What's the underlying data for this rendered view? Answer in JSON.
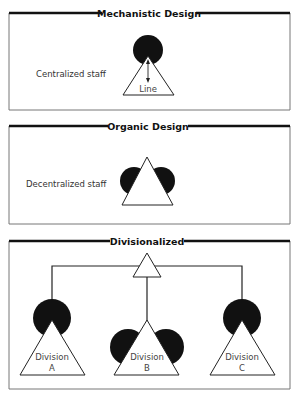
{
  "panels": [
    {
      "title": "Mechanistic Design",
      "side_label": "Centralized staff",
      "line_label": "Line"
    },
    {
      "title": "Organic Design",
      "side_label": "Decentralized staff"
    },
    {
      "title": "Divisionalized",
      "divisions": [
        {
          "label": "Division",
          "letter": "A"
        },
        {
          "label": "Division",
          "letter": "B"
        },
        {
          "label": "Division",
          "letter": "C"
        }
      ]
    }
  ],
  "colors": {
    "staff": "#111111",
    "line": "#ffffff",
    "frame_top": "#111111",
    "frame_side": "#777777"
  },
  "legend": {
    "staff_shape": "filled-circle",
    "line_shape": "triangle"
  }
}
